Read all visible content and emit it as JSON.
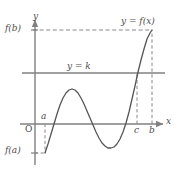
{
  "figure": {
    "kind": "math-graph",
    "width": 179,
    "height": 170,
    "background": "#ffffff",
    "colors": {
      "axis": "#808080",
      "curve": "#555555",
      "dashed": "#888888",
      "text": "#4d4d4d"
    }
  },
  "labels": {
    "axis_y": "y",
    "axis_x": "x",
    "origin": "O",
    "f_of_b": "f(b)",
    "f_of_a": "f(a)",
    "point_a": "a",
    "point_c": "c",
    "point_b": "b",
    "line_k": "y = k",
    "curve_name": "y = f(x)"
  },
  "chart_data": {
    "type": "line",
    "title": "",
    "xlabel": "x",
    "ylabel": "y",
    "grid": false,
    "legend": "none",
    "axes": {
      "y_axis_x_px": 35,
      "x_axis_y_px": 124,
      "y_axis_top_px": 18,
      "y_axis_bottom_px": 165,
      "x_axis_left_px": 20,
      "x_axis_right_px": 165
    },
    "marks": {
      "a_x_px": 45,
      "b_x_px": 152,
      "c_x_px": 137,
      "f_a_y_px": 153,
      "f_b_y_px": 30,
      "k_y_px": 73
    },
    "annotations": [
      {
        "name": "horizontal-line-y-equals-k",
        "text": "y = k",
        "y_px": 73
      },
      {
        "name": "curve-label",
        "text": "y = f(x)"
      },
      {
        "name": "dashed-level-f-b",
        "text": "f(b)",
        "y_px": 30
      },
      {
        "name": "dashed-level-f-a",
        "text": "f(a)",
        "y_px": 153
      },
      {
        "name": "tick-a",
        "text": "a",
        "x_px": 45
      },
      {
        "name": "tick-c",
        "text": "c",
        "x_px": 137
      },
      {
        "name": "tick-b",
        "text": "b",
        "x_px": 152
      }
    ],
    "curve_points_px": [
      [
        45,
        153
      ],
      [
        48,
        144
      ],
      [
        51,
        134
      ],
      [
        54,
        124
      ],
      [
        57,
        114
      ],
      [
        60,
        105
      ],
      [
        63,
        98
      ],
      [
        66,
        93
      ],
      [
        69,
        90
      ],
      [
        72,
        89
      ],
      [
        75,
        90
      ],
      [
        78,
        93
      ],
      [
        81,
        98
      ],
      [
        84,
        104
      ],
      [
        87,
        111
      ],
      [
        90,
        118
      ],
      [
        93,
        125
      ],
      [
        96,
        132
      ],
      [
        99,
        138
      ],
      [
        102,
        143
      ],
      [
        105,
        146
      ],
      [
        108,
        148
      ],
      [
        111,
        148
      ],
      [
        114,
        147
      ],
      [
        117,
        144
      ],
      [
        120,
        139
      ],
      [
        123,
        132
      ],
      [
        126,
        123
      ],
      [
        129,
        112
      ],
      [
        132,
        99
      ],
      [
        135,
        86
      ],
      [
        138,
        72
      ],
      [
        141,
        60
      ],
      [
        144,
        49
      ],
      [
        147,
        39
      ],
      [
        150,
        33
      ],
      [
        152,
        30
      ]
    ],
    "curve_description": "Cubic-like wave: rises from f(a) below axis, crosses x-axis near a, peaks, falls to a trough below the axis, then rises steeply crossing y=k at x=c and reaching f(b) at x=b."
  }
}
